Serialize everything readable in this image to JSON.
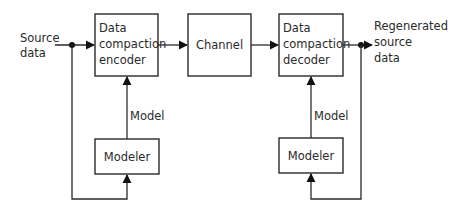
{
  "diagram": {
    "input_label": [
      "Source",
      "data"
    ],
    "output_label": [
      "Regenerated",
      "source",
      "data"
    ],
    "encoder": {
      "lines": [
        "Data",
        "compaction",
        "encoder"
      ]
    },
    "channel": {
      "label": "Channel"
    },
    "decoder": {
      "lines": [
        "Data",
        "compaction",
        "decoder"
      ]
    },
    "modeler_left": {
      "label": "Modeler",
      "edge_label": "Model"
    },
    "modeler_right": {
      "label": "Modeler",
      "edge_label": "Model"
    },
    "colors": {
      "stroke": "#2a2a2a",
      "background": "#ffffff"
    }
  }
}
